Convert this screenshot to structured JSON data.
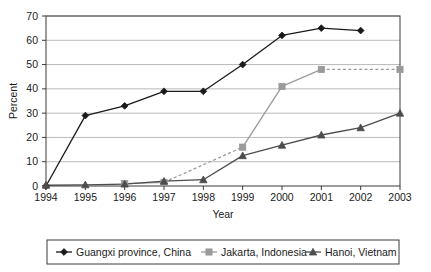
{
  "chart_data": {
    "type": "line",
    "title": "",
    "xlabel": "Year",
    "ylabel": "Percent",
    "categories": [
      "1994",
      "1995",
      "1996",
      "1997",
      "1998",
      "1999",
      "2000",
      "2001",
      "2002",
      "2003"
    ],
    "ylim": [
      0,
      70
    ],
    "ytick_step": 10,
    "yticks": [
      "0",
      "10",
      "20",
      "30",
      "40",
      "50",
      "60",
      "70"
    ],
    "grid": "horizontal",
    "legend_position": "bottom",
    "series": [
      {
        "name": "Guangxi province, China",
        "marker": "diamond",
        "color": "#1a1a1a",
        "values": [
          0,
          29,
          33,
          39,
          39,
          50,
          62,
          65,
          64,
          null
        ]
      },
      {
        "name": "Jakarta, Indonesia",
        "marker": "square",
        "color": "#9a9a9a",
        "values": [
          null,
          null,
          1,
          1.5,
          null,
          16,
          41,
          48,
          null,
          48
        ],
        "dashed_segments": [
          [
            3,
            5
          ],
          [
            7,
            9
          ]
        ]
      },
      {
        "name": "Hanoi, Vietnam",
        "marker": "triangle",
        "color": "#4d4d4d",
        "values": [
          0.3,
          0.5,
          0.8,
          2,
          2.6,
          12.5,
          16.8,
          21,
          24,
          30
        ]
      }
    ]
  },
  "legend": {
    "items": [
      {
        "label": "Guangxi province, China",
        "marker": "diamond",
        "color": "#1a1a1a"
      },
      {
        "label": "Jakarta, Indonesia",
        "marker": "square",
        "color": "#9a9a9a"
      },
      {
        "label": "Hanoi, Vietnam",
        "marker": "triangle",
        "color": "#4d4d4d"
      }
    ]
  },
  "colors": {
    "plot_border": "#3a3a3a",
    "gridline": "#a8a8a8",
    "background": "#ffffff",
    "text": "#1a1a1a"
  }
}
